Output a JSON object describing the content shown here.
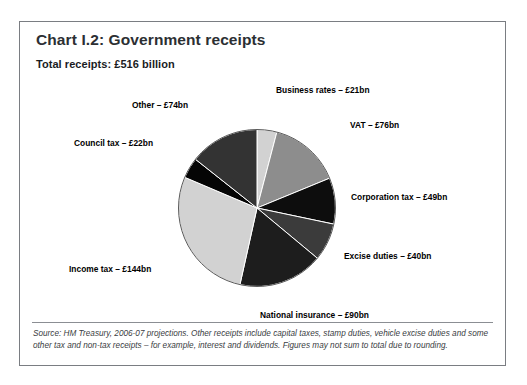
{
  "figure": {
    "title": "Chart I.2: Government receipts",
    "subtitle": "Total receipts: £516 billion",
    "source_note": "Source: HM Treasury, 2006-07 projections. Other receipts include capital taxes, stamp duties, vehicle excise duties and some other tax and non-tax receipts – for example, interest and dividends. Figures may not sum to total due to rounding."
  },
  "chart_data": {
    "type": "pie",
    "title": "Chart I.2: Government receipts",
    "subtitle": "Total receipts: £516 billion",
    "total": 516,
    "unit": "£ billion",
    "currency_symbol": "£",
    "start_angle_deg": 0,
    "direction": "clockwise",
    "legend": "none",
    "labels_outside": true,
    "categories": [
      "Business rates",
      "VAT",
      "Corporation tax",
      "Excise duties",
      "National insurance",
      "Income tax",
      "Council tax",
      "Other"
    ],
    "values": [
      21,
      76,
      49,
      40,
      90,
      144,
      22,
      74
    ],
    "labels": [
      "Business rates – £21bn",
      "VAT – £76bn",
      "Corporation tax – £49bn",
      "Excise duties – £40bn",
      "National insurance – £90bn",
      "Income tax – £144bn",
      "Council tax – £22bn",
      "Other – £74bn"
    ],
    "colors": [
      "#d2d2d2",
      "#8d8d8d",
      "#0d0d0d",
      "#3b3b3b",
      "#1d1d1d",
      "#d2d2d2",
      "#050505",
      "#333333"
    ],
    "slice_edge_color": "#ffffff",
    "outline_color": "#555555"
  }
}
